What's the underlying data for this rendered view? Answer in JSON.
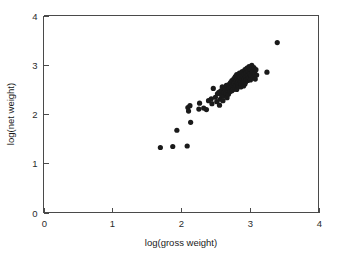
{
  "chart_data": {
    "type": "scatter",
    "title": "",
    "xlabel": "log(gross weight)",
    "ylabel": "log(net weight)",
    "xlim": [
      0,
      4
    ],
    "ylim": [
      0,
      4
    ],
    "xticks": [
      0,
      1,
      2,
      3,
      4
    ],
    "yticks": [
      0,
      1,
      2,
      3,
      4
    ],
    "xtick_labels": [
      "0",
      "1",
      "2",
      "3",
      "4"
    ],
    "ytick_labels": [
      "0",
      "1",
      "2",
      "3",
      "4"
    ],
    "grid": false,
    "legend": null,
    "marker": "filled-circle",
    "marker_color": "#1a1a1a",
    "marker_size": 2.6,
    "n_points": 95,
    "points": [
      [
        1.7,
        1.32
      ],
      [
        1.88,
        1.34
      ],
      [
        2.09,
        1.35
      ],
      [
        1.94,
        1.67
      ],
      [
        2.14,
        1.83
      ],
      [
        2.1,
        2.13
      ],
      [
        2.11,
        2.06
      ],
      [
        2.13,
        2.17
      ],
      [
        2.26,
        2.1
      ],
      [
        2.27,
        2.22
      ],
      [
        2.33,
        2.12
      ],
      [
        2.37,
        2.09
      ],
      [
        2.4,
        2.27
      ],
      [
        2.44,
        2.31
      ],
      [
        2.45,
        2.21
      ],
      [
        2.47,
        2.52
      ],
      [
        2.5,
        2.34
      ],
      [
        2.52,
        2.25
      ],
      [
        2.53,
        2.41
      ],
      [
        2.55,
        2.44
      ],
      [
        2.56,
        2.18
      ],
      [
        2.57,
        2.3
      ],
      [
        2.58,
        2.47
      ],
      [
        2.59,
        2.38
      ],
      [
        2.6,
        2.55
      ],
      [
        2.61,
        2.27
      ],
      [
        2.62,
        2.44
      ],
      [
        2.63,
        2.36
      ],
      [
        2.64,
        2.51
      ],
      [
        2.65,
        2.42
      ],
      [
        2.66,
        2.58
      ],
      [
        2.67,
        2.33
      ],
      [
        2.68,
        2.48
      ],
      [
        2.69,
        2.4
      ],
      [
        2.7,
        2.6
      ],
      [
        2.7,
        2.52
      ],
      [
        2.71,
        2.45
      ],
      [
        2.72,
        2.64
      ],
      [
        2.73,
        2.55
      ],
      [
        2.74,
        2.47
      ],
      [
        2.74,
        2.68
      ],
      [
        2.75,
        2.58
      ],
      [
        2.76,
        2.5
      ],
      [
        2.77,
        2.72
      ],
      [
        2.77,
        2.62
      ],
      [
        2.78,
        2.54
      ],
      [
        2.79,
        2.66
      ],
      [
        2.79,
        2.76
      ],
      [
        2.8,
        2.58
      ],
      [
        2.8,
        2.69
      ],
      [
        2.81,
        2.5
      ],
      [
        2.81,
        2.8
      ],
      [
        2.82,
        2.63
      ],
      [
        2.82,
        2.72
      ],
      [
        2.83,
        2.56
      ],
      [
        2.83,
        2.66
      ],
      [
        2.84,
        2.77
      ],
      [
        2.84,
        2.59
      ],
      [
        2.85,
        2.7
      ],
      [
        2.85,
        2.83
      ],
      [
        2.86,
        2.62
      ],
      [
        2.86,
        2.74
      ],
      [
        2.87,
        2.55
      ],
      [
        2.87,
        2.67
      ],
      [
        2.88,
        2.79
      ],
      [
        2.88,
        2.6
      ],
      [
        2.89,
        2.71
      ],
      [
        2.89,
        2.86
      ],
      [
        2.9,
        2.64
      ],
      [
        2.9,
        2.76
      ],
      [
        2.91,
        2.57
      ],
      [
        2.91,
        2.68
      ],
      [
        2.92,
        2.81
      ],
      [
        2.92,
        2.72
      ],
      [
        2.93,
        2.61
      ],
      [
        2.93,
        2.9
      ],
      [
        2.94,
        2.75
      ],
      [
        2.94,
        2.65
      ],
      [
        2.95,
        2.84
      ],
      [
        2.95,
        2.7
      ],
      [
        2.96,
        2.93
      ],
      [
        2.97,
        2.78
      ],
      [
        2.97,
        2.68
      ],
      [
        2.98,
        2.87
      ],
      [
        2.99,
        2.73
      ],
      [
        2.99,
        2.96
      ],
      [
        3.0,
        2.82
      ],
      [
        3.01,
        2.69
      ],
      [
        3.01,
        2.91
      ],
      [
        3.02,
        2.78
      ],
      [
        3.03,
        2.99
      ],
      [
        3.04,
        2.86
      ],
      [
        3.05,
        2.74
      ],
      [
        3.06,
        2.94
      ],
      [
        3.07,
        2.83
      ],
      [
        3.08,
        2.71
      ],
      [
        3.09,
        2.9
      ],
      [
        3.1,
        2.79
      ],
      [
        3.25,
        2.85
      ],
      [
        3.4,
        3.45
      ]
    ]
  },
  "axes": {
    "x_title": "log(gross weight)",
    "y_title": "log(net weight)"
  }
}
